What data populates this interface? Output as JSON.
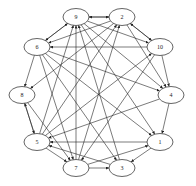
{
  "diagram": {
    "type": "directed-graph",
    "layout": "circular",
    "nodes": [
      {
        "id": "9",
        "label": "9",
        "x": 76,
        "y": 17
      },
      {
        "id": "2",
        "label": "2",
        "x": 122,
        "y": 17
      },
      {
        "id": "10",
        "label": "10",
        "x": 160,
        "y": 47
      },
      {
        "id": "4",
        "label": "4",
        "x": 171,
        "y": 95
      },
      {
        "id": "1",
        "label": "1",
        "x": 160,
        "y": 142
      },
      {
        "id": "3",
        "label": "3",
        "x": 122,
        "y": 168
      },
      {
        "id": "7",
        "label": "7",
        "x": 76,
        "y": 168
      },
      {
        "id": "5",
        "label": "5",
        "x": 37,
        "y": 142
      },
      {
        "id": "8",
        "label": "8",
        "x": 22,
        "y": 95
      },
      {
        "id": "6",
        "label": "6",
        "x": 37,
        "y": 47
      }
    ],
    "edges": [
      {
        "from": "9",
        "to": "2"
      },
      {
        "from": "2",
        "to": "9"
      },
      {
        "from": "9",
        "to": "6"
      },
      {
        "from": "6",
        "to": "9"
      },
      {
        "from": "2",
        "to": "10"
      },
      {
        "from": "10",
        "to": "2"
      },
      {
        "from": "2",
        "to": "6"
      },
      {
        "from": "2",
        "to": "8"
      },
      {
        "from": "2",
        "to": "4"
      },
      {
        "from": "9",
        "to": "10"
      },
      {
        "from": "9",
        "to": "4"
      },
      {
        "from": "10",
        "to": "6"
      },
      {
        "from": "10",
        "to": "4"
      },
      {
        "from": "10",
        "to": "7"
      },
      {
        "from": "5",
        "to": "10"
      },
      {
        "from": "6",
        "to": "4"
      },
      {
        "from": "6",
        "to": "8"
      },
      {
        "from": "6",
        "to": "1"
      },
      {
        "from": "6",
        "to": "3"
      },
      {
        "from": "6",
        "to": "7"
      },
      {
        "from": "8",
        "to": "5"
      },
      {
        "from": "5",
        "to": "8"
      },
      {
        "from": "8",
        "to": "7"
      },
      {
        "from": "4",
        "to": "1"
      },
      {
        "from": "4",
        "to": "5"
      },
      {
        "from": "1",
        "to": "5"
      },
      {
        "from": "1",
        "to": "3"
      },
      {
        "from": "3",
        "to": "5"
      },
      {
        "from": "3",
        "to": "9"
      },
      {
        "from": "7",
        "to": "3"
      },
      {
        "from": "7",
        "to": "1"
      },
      {
        "from": "7",
        "to": "9"
      },
      {
        "from": "7",
        "to": "2"
      },
      {
        "from": "5",
        "to": "7"
      },
      {
        "from": "5",
        "to": "9"
      },
      {
        "from": "5",
        "to": "2"
      },
      {
        "from": "9",
        "to": "1"
      }
    ]
  }
}
